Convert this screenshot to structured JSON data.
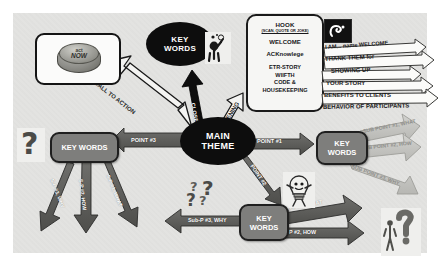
{
  "diagram": {
    "background_color": "#e3e3e1",
    "accent_dark": "#0d0d0d",
    "accent_gray": "#7e7e7c"
  },
  "nodes": {
    "main_theme": {
      "label_line1": "MAIN",
      "label_line2": "THEME",
      "shape": "ellipse",
      "fill": "#0d0d0d"
    },
    "key_words_top": {
      "label_line1": "KEY",
      "label_line2": "WORDS",
      "shape": "ellipse",
      "fill": "#0d0d0d"
    },
    "key_words_left": {
      "label": "KEY WORDS",
      "shape": "rounded-box",
      "fill": "#7e7e7c"
    },
    "key_words_right": {
      "label_line1": "KEY",
      "label_line2": "WORDS",
      "shape": "rounded-box",
      "fill": "#7e7e7c"
    },
    "key_words_bottom": {
      "label_line1": "KEY",
      "label_line2": "WORDS",
      "shape": "rounded-box",
      "fill": "#7e7e7c"
    },
    "act_now_button": {
      "label_line1": "act",
      "label_line2": "NOW",
      "shape": "rounded-box-white"
    }
  },
  "hook_panel": {
    "title": "HOOK",
    "subtitle": "(SCAN, QUOTE OR JOKE)",
    "items": [
      "WELCOME",
      "ACKnowlege",
      "ETR-STORY",
      "WIIFTH",
      "CODE &",
      "HOUSEKEEPING"
    ]
  },
  "ribbon_arrows": [
    {
      "text": "I AM... name WELCOME"
    },
    {
      "text": "THANK THEM for"
    },
    {
      "text": "SHOWING UP"
    },
    {
      "text": "YOUR STORY"
    },
    {
      "text": "BENEFITS TO CLIENTS"
    },
    {
      "text": "BEHAVIOR OF PARTICIPANTS"
    }
  ],
  "connector_labels": {
    "call_to_action": "CALL TO ACTION",
    "close": "CLOSE",
    "opening": "OPENING",
    "point_1": "POINT #1",
    "point_2": "POINT #2",
    "point_3": "POINT #3",
    "sub_left_1": "S-P #3, WHY",
    "sub_left_2": "S-P #2, HOW",
    "sub_left_3": "S-P #1, WHAT",
    "sub_right_1": "SUB POINT #1, WHAT",
    "sub_right_2": "SUB POINT #2, HOW",
    "sub_right_3": "SUB POINT #3, WHY",
    "sub_bottom_1": "Sub-P #1, WHAT",
    "sub_bottom_2": "Sub-P #2, HOW",
    "sub_bottom_3": "Sub-P #3, WHY"
  },
  "icons": {
    "speaker_figure": "speaker-figure-icon",
    "speech_tile": "speech-swoosh-icon",
    "lightbulb_figure": "lightbulb-character-icon",
    "question_mark_left": "question-mark-icon",
    "question_cluster": "question-mark-cluster-icon",
    "question_person": "person-with-question-mark-icon"
  }
}
